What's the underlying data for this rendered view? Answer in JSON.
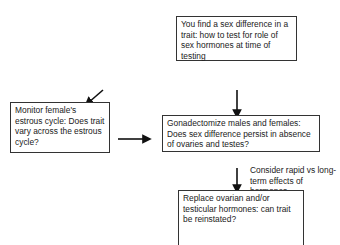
{
  "nodes": {
    "start": "You find a sex difference in a trait: how to test for role of sex hormones at time of testing",
    "estrous": "Monitor female's estrous cycle: Does trait vary across the estrous cycle?",
    "gonadectomize": "Gonadectomize males and females: Does sex difference persist in absence of ovaries and testes?",
    "replace": "Replace ovarian and/or testicular hormones: can trait be reinstated?"
  },
  "annotations": {
    "rapid_vs_long": "Consider rapid vs long-term effects of hormones"
  }
}
